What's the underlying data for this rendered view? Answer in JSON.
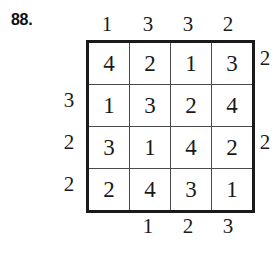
{
  "figure": {
    "label": "88.",
    "puzzle_type": "skyscrapers",
    "grid_size": 4
  },
  "grid": {
    "rows": [
      [
        "4",
        "2",
        "1",
        "3"
      ],
      [
        "1",
        "3",
        "2",
        "4"
      ],
      [
        "3",
        "1",
        "4",
        "2"
      ],
      [
        "2",
        "4",
        "3",
        "1"
      ]
    ]
  },
  "clues": {
    "top": [
      "1",
      "3",
      "3",
      "2"
    ],
    "bottom": [
      "",
      "1",
      "2",
      "3"
    ],
    "left": [
      "",
      "3",
      "2",
      "2"
    ],
    "right": [
      "2",
      "",
      "2",
      ""
    ]
  }
}
